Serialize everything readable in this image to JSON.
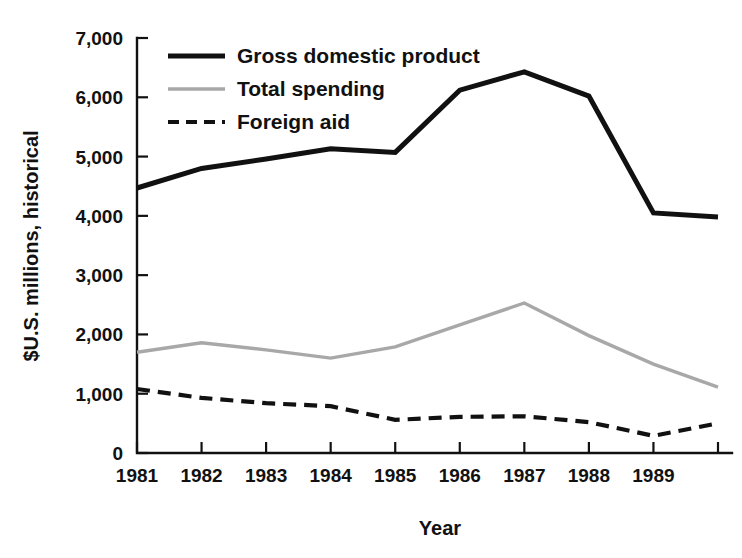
{
  "chart_data": {
    "type": "line",
    "title": "",
    "xlabel": "Year",
    "ylabel": "$U.S. millions, historical",
    "x": [
      1981,
      1982,
      1983,
      1984,
      1985,
      1986,
      1987,
      1988,
      1989,
      1990
    ],
    "xtick_labels": [
      "1981",
      "1982",
      "1983",
      "1984",
      "1985",
      "1986",
      "1987",
      "1988",
      "1989"
    ],
    "ytick_labels": [
      "0",
      "1,000",
      "2,000",
      "3,000",
      "4,000",
      "5,000",
      "6,000",
      "7,000"
    ],
    "ytick_values": [
      0,
      1000,
      2000,
      3000,
      4000,
      5000,
      6000,
      7000
    ],
    "xlim": [
      1981,
      1990
    ],
    "ylim": [
      0,
      7000
    ],
    "grid": false,
    "legend_position": "top-left inside axes",
    "series": [
      {
        "name": "Gross domestic product",
        "color": "#111111",
        "style": "solid",
        "width": 5,
        "values": [
          4470,
          4800,
          4960,
          5130,
          5070,
          6120,
          6430,
          6020,
          4050,
          3980
        ]
      },
      {
        "name": "Total spending",
        "color": "#a8a8a8",
        "style": "solid",
        "width": 3.4,
        "values": [
          1700,
          1860,
          1740,
          1600,
          1790,
          2160,
          2530,
          1980,
          1500,
          1110
        ]
      },
      {
        "name": "Foreign aid",
        "color": "#111111",
        "style": "dashed",
        "width": 4.2,
        "values": [
          1080,
          930,
          840,
          790,
          560,
          610,
          620,
          520,
          290,
          500
        ]
      }
    ]
  }
}
